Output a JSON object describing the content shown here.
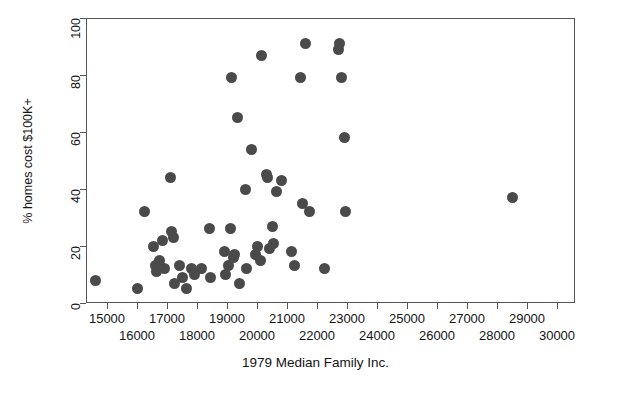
{
  "chart_data": {
    "type": "scatter",
    "title": "",
    "xlabel": "1979 Median Family Inc.",
    "ylabel": "% homes cost $100K+",
    "xlim": [
      14300,
      30600
    ],
    "ylim": [
      0,
      100
    ],
    "grid": false,
    "legend": "none",
    "marker": {
      "shape": "circle",
      "color": "#4a4a4a",
      "size_px": 11
    },
    "xticks": [
      15000,
      16000,
      17000,
      18000,
      19000,
      20000,
      21000,
      22000,
      23000,
      24000,
      25000,
      26000,
      27000,
      28000,
      29000,
      30000
    ],
    "xtick_labels_row_upper": [
      "15000",
      "17000",
      "19000",
      "21000",
      "23000",
      "25000",
      "27000",
      "29000"
    ],
    "xtick_labels_row_lower": [
      "16000",
      "18000",
      "20000",
      "22000",
      "24000",
      "26000",
      "28000",
      "30000"
    ],
    "yticks": [
      0,
      20,
      40,
      60,
      80,
      100
    ],
    "ytick_labels": [
      "0",
      "20",
      "40",
      "60",
      "80",
      "100"
    ],
    "n_points": 57,
    "points": [
      {
        "x": 14600,
        "y": 8
      },
      {
        "x": 16000,
        "y": 5
      },
      {
        "x": 16250,
        "y": 32
      },
      {
        "x": 16550,
        "y": 20
      },
      {
        "x": 16600,
        "y": 13
      },
      {
        "x": 16650,
        "y": 11
      },
      {
        "x": 16750,
        "y": 15
      },
      {
        "x": 16850,
        "y": 22
      },
      {
        "x": 16900,
        "y": 12
      },
      {
        "x": 17100,
        "y": 44
      },
      {
        "x": 17150,
        "y": 25
      },
      {
        "x": 17200,
        "y": 23
      },
      {
        "x": 17250,
        "y": 7
      },
      {
        "x": 17400,
        "y": 13
      },
      {
        "x": 17500,
        "y": 9
      },
      {
        "x": 17650,
        "y": 5
      },
      {
        "x": 17800,
        "y": 12
      },
      {
        "x": 17900,
        "y": 10
      },
      {
        "x": 18150,
        "y": 12
      },
      {
        "x": 18400,
        "y": 26
      },
      {
        "x": 18450,
        "y": 9
      },
      {
        "x": 18900,
        "y": 18
      },
      {
        "x": 18950,
        "y": 10
      },
      {
        "x": 19050,
        "y": 13
      },
      {
        "x": 19100,
        "y": 26
      },
      {
        "x": 19150,
        "y": 79
      },
      {
        "x": 19200,
        "y": 16
      },
      {
        "x": 19250,
        "y": 17
      },
      {
        "x": 19350,
        "y": 65
      },
      {
        "x": 19400,
        "y": 7
      },
      {
        "x": 19600,
        "y": 40
      },
      {
        "x": 19650,
        "y": 12
      },
      {
        "x": 19800,
        "y": 54
      },
      {
        "x": 19950,
        "y": 17
      },
      {
        "x": 20000,
        "y": 20
      },
      {
        "x": 20100,
        "y": 15
      },
      {
        "x": 20150,
        "y": 87
      },
      {
        "x": 20300,
        "y": 45
      },
      {
        "x": 20350,
        "y": 44
      },
      {
        "x": 20400,
        "y": 19
      },
      {
        "x": 20500,
        "y": 27
      },
      {
        "x": 20550,
        "y": 21
      },
      {
        "x": 20650,
        "y": 39
      },
      {
        "x": 20800,
        "y": 43
      },
      {
        "x": 21150,
        "y": 18
      },
      {
        "x": 21250,
        "y": 13
      },
      {
        "x": 21450,
        "y": 79
      },
      {
        "x": 21500,
        "y": 35
      },
      {
        "x": 21600,
        "y": 91
      },
      {
        "x": 21750,
        "y": 32
      },
      {
        "x": 22700,
        "y": 89
      },
      {
        "x": 22750,
        "y": 91
      },
      {
        "x": 22800,
        "y": 79
      },
      {
        "x": 22900,
        "y": 58
      },
      {
        "x": 22950,
        "y": 32
      },
      {
        "x": 22250,
        "y": 12
      },
      {
        "x": 28500,
        "y": 37
      }
    ]
  },
  "axes": {
    "y_title": "% homes cost $100K+",
    "x_title": "1979 Median Family Inc."
  }
}
